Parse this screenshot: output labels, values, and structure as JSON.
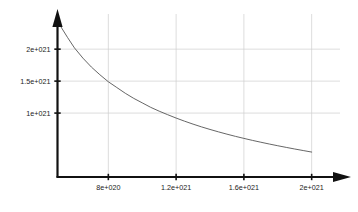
{
  "chart_data": {
    "type": "line",
    "title": "",
    "subtitle": "",
    "xlabel": "",
    "ylabel": "",
    "grid": true,
    "legend": null,
    "axis_style": "arrow-tipped",
    "background_color": "#ffffff",
    "axis_color": "#111111",
    "grid_color": "#cfcfcf",
    "curve_color": "#555555",
    "xlim": [
      5e+20,
      2.12e+21
    ],
    "ylim": [
      0.0,
      2.55e+21
    ],
    "xticks": [
      8e+20,
      1.2e+21,
      1.6e+21,
      2e+21
    ],
    "xtick_labels": [
      "8e+020",
      "1.2e+021",
      "1.6e+021",
      "2e+021"
    ],
    "yticks": [
      1e+21,
      1.5e+21,
      2e+21
    ],
    "ytick_labels": [
      "1e+021",
      "1.5e+021",
      "2e+021"
    ],
    "series": [
      {
        "name": "decay",
        "style": "solid",
        "x": [
          5.2e+20,
          5.6e+20,
          6e+20,
          6.5e+20,
          7e+20,
          7.5e+20,
          8e+20,
          8.5e+20,
          9e+20,
          9.5e+20,
          1e+21,
          1.05e+21,
          1.1e+21,
          1.15e+21,
          1.2e+21,
          1.25e+21,
          1.3e+21,
          1.35e+21,
          1.4e+21,
          1.45e+21,
          1.5e+21,
          1.55e+21,
          1.6e+21,
          1.65e+21,
          1.7e+21,
          1.75e+21,
          1.8e+21,
          1.85e+21,
          1.9e+21,
          1.95e+21,
          2e+21
        ],
        "y": [
          2.35e+21,
          2.18e+21,
          2.02e+21,
          1.86e+21,
          1.72e+21,
          1.6e+21,
          1.49e+21,
          1.4e+21,
          1.31e+21,
          1.23e+21,
          1.16e+21,
          1.09e+21,
          1.03e+21,
          9.75e+20,
          9.22e+20,
          8.73e+20,
          8.27e+20,
          7.84e+20,
          7.44e+20,
          7.06e+20,
          6.7e+20,
          6.36e+20,
          6.04e+20,
          5.73e+20,
          5.44e+20,
          5.16e+20,
          4.89e+20,
          4.63e+20,
          4.38e+20,
          4.14e+20,
          3.9e+20
        ]
      }
    ],
    "annotations": []
  },
  "axes": {
    "y_arrow_name": "y-axis-arrowhead",
    "x_arrow_name": "x-axis-arrowhead"
  }
}
